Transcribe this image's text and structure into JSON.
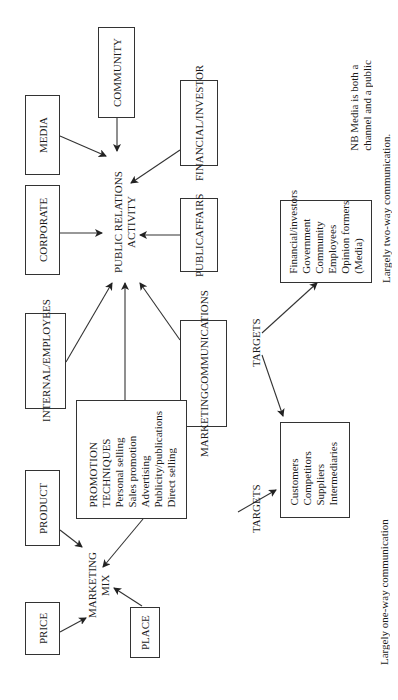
{
  "pr_hub": {
    "line1": "PUBLIC RELATIONS",
    "line2": "ACTIVITY"
  },
  "mm_hub": {
    "line1": "MARKETING",
    "line2": "MIX"
  },
  "publics": {
    "community": "COMMUNITY",
    "media": "MEDIA",
    "financial": {
      "line1": "FINANCIAL/",
      "line2": "INVESTOR"
    },
    "corporate": "CORPORATE",
    "public_affairs": {
      "line1": "PUBLIC",
      "line2": "AFFAIRS"
    },
    "internal": {
      "line1": "INTERNAL/",
      "line2": "EMPLOYEES"
    },
    "marcom": {
      "line1": "MARKETING",
      "line2": "COMMUNICATIONS"
    }
  },
  "mix": {
    "product": "PRODUCT",
    "price": "PRICE",
    "place": "PLACE",
    "promotion": {
      "title1": "PROMOTION",
      "title2": "TECHNIQUES",
      "items": [
        "Personal selling",
        "Sales promotion",
        "Advertising",
        "Publicity/publications",
        "Direct selling"
      ]
    }
  },
  "targets_label_1": "TARGETS",
  "targets_label_2": "TARGETS",
  "marketing_targets": [
    "Customers",
    "Competitors",
    "Suppliers",
    "Intermediaries"
  ],
  "pr_targets": [
    "Financial/investors",
    "Government",
    "Community",
    "Employees",
    "Opinion formers",
    "(Media)"
  ],
  "notes": {
    "one_way": "Largely one-way communication",
    "two_way": "Largely two-way communication.",
    "nb_line1": "NB Media is both a",
    "nb_line2": "channel and a public"
  }
}
